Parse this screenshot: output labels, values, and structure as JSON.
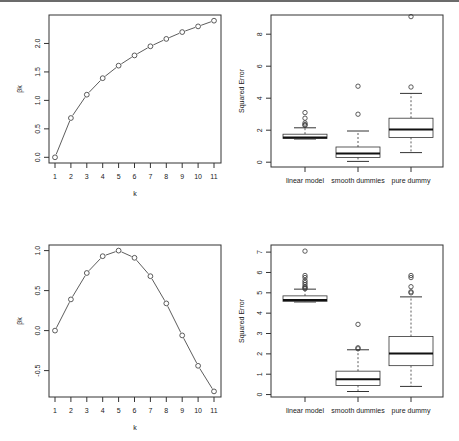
{
  "chart_data": [
    {
      "type": "line",
      "panel": "top-left",
      "title": "",
      "xlabel": "k",
      "ylabel": "βk",
      "x": [
        1,
        2,
        3,
        4,
        5,
        6,
        7,
        8,
        9,
        10,
        11
      ],
      "values": [
        0.0,
        0.69,
        1.1,
        1.39,
        1.61,
        1.79,
        1.95,
        2.08,
        2.2,
        2.3,
        2.4
      ],
      "xticks": [
        "1",
        "2",
        "3",
        "4",
        "5",
        "6",
        "7",
        "8",
        "9",
        "10",
        "11"
      ],
      "yticks": [
        "0.0",
        "0.5",
        "1.0",
        "1.5",
        "2.0"
      ],
      "ylim": [
        0.0,
        2.4
      ],
      "marker": "open-circle",
      "grid": false,
      "legend": null
    },
    {
      "type": "box",
      "panel": "top-right",
      "title": "",
      "xlabel": "",
      "ylabel": "Squared Error",
      "categories": [
        "linear model",
        "smooth dummies",
        "pure dummy"
      ],
      "yticks": [
        "0",
        "2",
        "4",
        "6",
        "8"
      ],
      "ylim": [
        0,
        9.1
      ],
      "boxes": [
        {
          "name": "linear model",
          "whisker_low": 1.45,
          "q1": 1.48,
          "median": 1.55,
          "q3": 1.75,
          "whisker_high": 2.15,
          "outliers": [
            2.3,
            2.35,
            2.45,
            2.75,
            3.1
          ]
        },
        {
          "name": "smooth dummies",
          "whisker_low": 0.05,
          "q1": 0.3,
          "median": 0.55,
          "q3": 0.95,
          "whisker_high": 1.95,
          "outliers": [
            3.0,
            4.75
          ]
        },
        {
          "name": "pure dummy",
          "whisker_low": 0.6,
          "q1": 1.55,
          "median": 2.05,
          "q3": 2.75,
          "whisker_high": 4.3,
          "outliers": [
            4.7,
            9.1
          ]
        }
      ]
    },
    {
      "type": "line",
      "panel": "bottom-left",
      "title": "",
      "xlabel": "k",
      "ylabel": "βk",
      "x": [
        1,
        2,
        3,
        4,
        5,
        6,
        7,
        8,
        9,
        10,
        11
      ],
      "values": [
        0.0,
        0.39,
        0.72,
        0.93,
        1.0,
        0.91,
        0.68,
        0.34,
        -0.06,
        -0.44,
        -0.76
      ],
      "xticks": [
        "1",
        "2",
        "3",
        "4",
        "5",
        "6",
        "7",
        "8",
        "9",
        "10",
        "11"
      ],
      "yticks": [
        "-0.5",
        "0.0",
        "0.5",
        "1.0"
      ],
      "ylim": [
        -0.76,
        1.0
      ],
      "marker": "open-circle",
      "grid": false,
      "legend": null
    },
    {
      "type": "box",
      "panel": "bottom-right",
      "title": "",
      "xlabel": "",
      "ylabel": "Squared Error",
      "categories": [
        "linear model",
        "smooth dummies",
        "pure dummy"
      ],
      "yticks": [
        "0",
        "1",
        "2",
        "3",
        "4",
        "5",
        "6",
        "7"
      ],
      "ylim": [
        0,
        7.05
      ],
      "boxes": [
        {
          "name": "linear model",
          "whisker_low": 4.55,
          "q1": 4.58,
          "median": 4.65,
          "q3": 4.85,
          "whisker_high": 5.18,
          "outliers": [
            5.2,
            5.25,
            5.3,
            5.4,
            5.5,
            5.6,
            5.75,
            5.85,
            7.05
          ]
        },
        {
          "name": "smooth dummies",
          "whisker_low": 0.15,
          "q1": 0.45,
          "median": 0.75,
          "q3": 1.15,
          "whisker_high": 2.2,
          "outliers": [
            2.25,
            2.3,
            3.45
          ]
        },
        {
          "name": "pure dummy",
          "whisker_low": 0.4,
          "q1": 1.42,
          "median": 2.02,
          "q3": 2.85,
          "whisker_high": 4.8,
          "outliers": [
            5.0,
            5.05,
            5.3,
            5.75,
            5.85
          ]
        }
      ]
    }
  ],
  "layout": {
    "panels": [
      {
        "box": [
          49,
          15,
          221,
          163
        ],
        "yrange": [
          -0.1,
          2.5
        ],
        "ytick_vals": [
          0,
          0.5,
          1.0,
          1.5,
          2.0
        ]
      },
      {
        "box": [
          271,
          15,
          443,
          167
        ],
        "yrange": [
          -0.3,
          9.2
        ],
        "ytick_vals": [
          0,
          2,
          4,
          6,
          8
        ]
      },
      {
        "box": [
          49,
          245,
          221,
          397
        ],
        "yrange": [
          -0.83,
          1.07
        ],
        "ytick_vals": [
          -0.5,
          0,
          0.5,
          1.0
        ]
      },
      {
        "box": [
          271,
          245,
          443,
          397
        ],
        "yrange": [
          -0.12,
          7.35
        ],
        "ytick_vals": [
          0,
          1,
          2,
          3,
          4,
          5,
          6,
          7
        ]
      }
    ]
  }
}
